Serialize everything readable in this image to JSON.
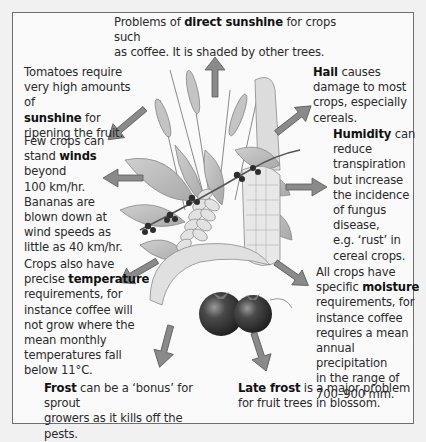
{
  "diagram": {
    "colors": {
      "frame_border": "#6f6f6f",
      "background": "#fafafa",
      "arrow_fill": "#8a8a8a",
      "arrow_stroke": "#5a5a5a",
      "leaf": "#b9b9b9",
      "tomato": "#3a3a3a"
    },
    "center_illustration": "crops-illustration (coffee branch, wheat, maize, banana, tomatoes)",
    "annotations": {
      "top": {
        "pre": "Problems of ",
        "bold": "direct sunshine",
        "post_line1": " for crops such",
        "line2": "as coffee. It is shaded by other trees."
      },
      "sunshine": {
        "line1": "Tomatoes require",
        "line2": "very high amounts of",
        "bold": "sunshine",
        "post": " for",
        "line4": "ripening the fruit."
      },
      "winds": {
        "line1": "Few crops can",
        "pre": "stand ",
        "bold": "winds",
        "line3": "beyond",
        "line4": "100 km/hr.",
        "line5": "Bananas are",
        "line6": "blown down at",
        "line7": "wind speeds as",
        "line8": "little as 40 km/hr."
      },
      "temperature": {
        "line1": "Crops also have",
        "pre": "precise ",
        "bold": "temperature",
        "line3": "requirements, for",
        "line4": "instance coffee will",
        "line5": "not grow where the",
        "line6": "mean monthly",
        "line7": "temperatures fall",
        "line8": "below 11°C."
      },
      "frost": {
        "bold": "Frost",
        "post": " can be a ‘bonus’ for sprout",
        "line2": "growers as it kills off the pests."
      },
      "hail": {
        "bold": "Hail",
        "post": " causes",
        "line2": "damage to most",
        "line3": "crops, especially",
        "line4": "cereals."
      },
      "humidity": {
        "bold": "Humidity",
        "post": " can",
        "line2": "reduce",
        "line3": "transpiration",
        "line4": "but increase",
        "line5": "the incidence",
        "line6": "of fungus",
        "line7": "disease,",
        "line8": "e.g. ‘rust’ in",
        "line9": "cereal crops."
      },
      "moisture": {
        "line1": "All crops have",
        "pre": "specific ",
        "bold": "moisture",
        "line3": "requirements, for",
        "line4": "instance coffee",
        "line5": "requires a mean",
        "line6": "annual precipitation",
        "line7": "in the range of",
        "line8": "700–900 mm."
      },
      "late_frost": {
        "bold": "Late frost",
        "post": " is a major problem",
        "line2": "for fruit trees in blossom."
      }
    },
    "arrows": [
      {
        "name": "arrow-up",
        "direction": "up"
      },
      {
        "name": "arrow-up-left",
        "direction": "up-left"
      },
      {
        "name": "arrow-left",
        "direction": "left"
      },
      {
        "name": "arrow-down-left",
        "direction": "down-left"
      },
      {
        "name": "arrow-down-left-lower",
        "direction": "down"
      },
      {
        "name": "arrow-up-right",
        "direction": "up-right"
      },
      {
        "name": "arrow-right",
        "direction": "right"
      },
      {
        "name": "arrow-down-right",
        "direction": "down-right"
      },
      {
        "name": "arrow-down-right-lower",
        "direction": "down"
      }
    ]
  }
}
